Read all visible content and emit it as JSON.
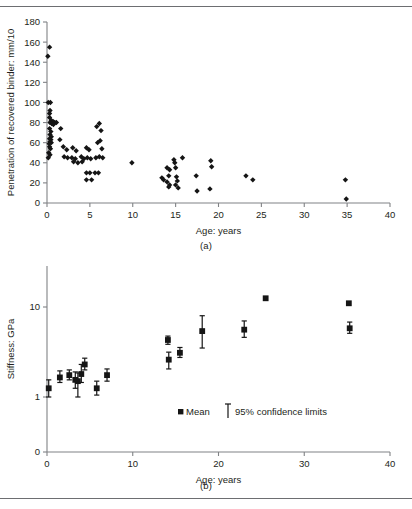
{
  "figure": {
    "panel_a_caption": "(a)",
    "panel_b_caption": "(b)"
  },
  "chart_data": [
    {
      "id": "panel-a",
      "type": "scatter",
      "title": "",
      "xlabel": "Age: years",
      "ylabel": "Penetration of recovered binder: mm/10",
      "xlim": [
        0,
        40
      ],
      "ylim": [
        0,
        180
      ],
      "xticks": [
        0,
        5,
        10,
        15,
        20,
        25,
        30,
        35,
        40
      ],
      "xticklabels": [
        "0",
        "5",
        "10",
        "15",
        "20",
        "25",
        "30",
        "35",
        "40"
      ],
      "yticks": [
        0,
        20,
        40,
        60,
        80,
        100,
        120,
        140,
        160,
        180
      ],
      "yticklabels": [
        "0",
        "20",
        "40",
        "60",
        "80",
        "100",
        "120",
        "140",
        "160",
        "180"
      ],
      "grid": false,
      "legend": "none",
      "marker": "diamond",
      "marker_color": "#151515",
      "points": [
        [
          0.3,
          155
        ],
        [
          0.1,
          146
        ],
        [
          0.15,
          100
        ],
        [
          0.4,
          100
        ],
        [
          0.35,
          92
        ],
        [
          0.3,
          89
        ],
        [
          0.3,
          85
        ],
        [
          0.5,
          82
        ],
        [
          0.7,
          81
        ],
        [
          0.9,
          80
        ],
        [
          1.1,
          80
        ],
        [
          0.35,
          80
        ],
        [
          0.55,
          79
        ],
        [
          0.75,
          78
        ],
        [
          0.3,
          74
        ],
        [
          0.45,
          71
        ],
        [
          0.35,
          68
        ],
        [
          0.5,
          66
        ],
        [
          0.3,
          64
        ],
        [
          0.45,
          63
        ],
        [
          0.35,
          61
        ],
        [
          0.5,
          60
        ],
        [
          0.25,
          59
        ],
        [
          0.3,
          56
        ],
        [
          0.4,
          54
        ],
        [
          0.2,
          50
        ],
        [
          0.35,
          48
        ],
        [
          0.15,
          45
        ],
        [
          1.6,
          74
        ],
        [
          1.5,
          63
        ],
        [
          1.9,
          56
        ],
        [
          2.3,
          53
        ],
        [
          2.0,
          46
        ],
        [
          2.4,
          45
        ],
        [
          3.0,
          55
        ],
        [
          3.4,
          52
        ],
        [
          2.9,
          45
        ],
        [
          3.3,
          44
        ],
        [
          3.1,
          41
        ],
        [
          3.6,
          40
        ],
        [
          4.0,
          46
        ],
        [
          4.3,
          44
        ],
        [
          4.1,
          41
        ],
        [
          4.6,
          55
        ],
        [
          4.9,
          53
        ],
        [
          4.7,
          45
        ],
        [
          5.1,
          44
        ],
        [
          4.6,
          30
        ],
        [
          5.0,
          30
        ],
        [
          4.6,
          23
        ],
        [
          5.2,
          23
        ],
        [
          5.6,
          30
        ],
        [
          6.0,
          30
        ],
        [
          5.7,
          45
        ],
        [
          6.1,
          46
        ],
        [
          5.9,
          60
        ],
        [
          6.2,
          62
        ],
        [
          5.8,
          76
        ],
        [
          6.1,
          79
        ],
        [
          6.3,
          72
        ],
        [
          6.4,
          54
        ],
        [
          6.5,
          45
        ],
        [
          9.9,
          40
        ],
        [
          13.4,
          25
        ],
        [
          13.6,
          23
        ],
        [
          14.0,
          35
        ],
        [
          14.3,
          33
        ],
        [
          14.2,
          27
        ],
        [
          14.0,
          21
        ],
        [
          14.3,
          18
        ],
        [
          14.2,
          16
        ],
        [
          14.8,
          43
        ],
        [
          14.9,
          40
        ],
        [
          15.0,
          35
        ],
        [
          15.1,
          26
        ],
        [
          15.2,
          22
        ],
        [
          15.0,
          18
        ],
        [
          15.8,
          45
        ],
        [
          15.3,
          15
        ],
        [
          17.4,
          27
        ],
        [
          17.5,
          12
        ],
        [
          19.1,
          42
        ],
        [
          19.2,
          36
        ],
        [
          19.0,
          14
        ],
        [
          23.2,
          27
        ],
        [
          24.0,
          23
        ],
        [
          34.8,
          23
        ],
        [
          34.9,
          4
        ]
      ]
    },
    {
      "id": "panel-b",
      "type": "scatter",
      "title": "",
      "xlabel": "Age: years",
      "ylabel": "Stiffness: GPa",
      "xlim": [
        0,
        40
      ],
      "yscale": "log-broken",
      "xticks": [
        0,
        10,
        20,
        30,
        40
      ],
      "xticklabels": [
        "0",
        "10",
        "20",
        "30",
        "40"
      ],
      "yticklabels": [
        "0",
        "1",
        "10"
      ],
      "grid": false,
      "legend_position": "inside-lower-right",
      "legend": [
        {
          "marker": "square",
          "label": "Mean"
        },
        {
          "marker": "errorbar",
          "label": "95% confidence limits"
        }
      ],
      "marker": "square",
      "marker_color": "#151515",
      "series_name": "Mean",
      "errorbar_name": "95% confidence limits",
      "points": [
        {
          "x": 0.2,
          "mean": 1.25,
          "low": 1.0,
          "high": 1.55
        },
        {
          "x": 1.5,
          "mean": 1.65,
          "low": 1.45,
          "high": 1.95
        },
        {
          "x": 2.6,
          "mean": 1.75,
          "low": 1.55,
          "high": 2.0
        },
        {
          "x": 3.3,
          "mean": 1.55,
          "low": 1.25,
          "high": 1.9
        },
        {
          "x": 3.6,
          "mean": 1.5,
          "low": 1.0,
          "high": 1.85
        },
        {
          "x": 4.0,
          "mean": 1.8,
          "low": 1.45,
          "high": 2.3
        },
        {
          "x": 4.4,
          "mean": 2.3,
          "low": 2.0,
          "high": 2.7
        },
        {
          "x": 5.8,
          "mean": 1.25,
          "low": 1.05,
          "high": 1.5
        },
        {
          "x": 7.0,
          "mean": 1.75,
          "low": 1.5,
          "high": 2.05
        },
        {
          "x": 14.1,
          "mean": 4.3,
          "low": 3.85,
          "high": 4.75
        },
        {
          "x": 14.2,
          "mean": 2.6,
          "low": 2.05,
          "high": 3.15
        },
        {
          "x": 15.5,
          "mean": 3.1,
          "low": 2.75,
          "high": 3.55
        },
        {
          "x": 18.1,
          "mean": 5.4,
          "low": 3.5,
          "high": 8.0
        },
        {
          "x": 23.0,
          "mean": 5.6,
          "low": 4.6,
          "high": 7.0
        },
        {
          "x": 25.5,
          "mean": 12.5,
          "low": 12.5,
          "high": 12.5
        },
        {
          "x": 35.2,
          "mean": 11.0,
          "low": 11.0,
          "high": 11.0
        },
        {
          "x": 35.3,
          "mean": 5.8,
          "low": 5.1,
          "high": 6.8
        }
      ]
    }
  ]
}
